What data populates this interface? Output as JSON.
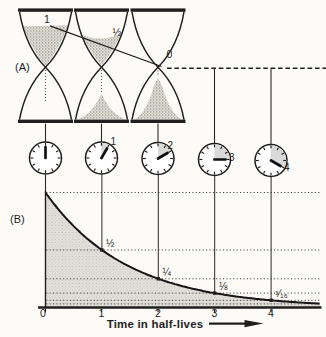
{
  "panel_a_label": "(A)",
  "panel_b_label": "(B)",
  "hourglasses": [
    {
      "label": "1",
      "top_bulb": "full",
      "bottom_bulb": "empty"
    },
    {
      "label": "½",
      "top_bulb": "half",
      "bottom_bulb": "small pile"
    },
    {
      "label": "0",
      "top_bulb": "empty",
      "bottom_bulb": "full pile"
    }
  ],
  "clocks": [
    {
      "hours": 0,
      "label": ""
    },
    {
      "hours": 1,
      "label": "1"
    },
    {
      "hours": 2,
      "label": "2"
    },
    {
      "hours": 3,
      "label": "3"
    },
    {
      "hours": 4,
      "label": "4"
    }
  ],
  "graph": {
    "x_axis_title": "Time in half-lives",
    "x_ticks": [
      "0",
      "1",
      "2",
      "3",
      "4"
    ],
    "point_labels": [
      "½",
      "¼",
      "⅛",
      "¹⁄₁₆"
    ]
  },
  "chart_data": {
    "type": "area",
    "x": [
      0,
      1,
      2,
      3,
      4
    ],
    "values": [
      1,
      0.5,
      0.25,
      0.125,
      0.0625
    ],
    "point_labels": [
      "½",
      "¼",
      "⅛",
      "¹⁄₁₆"
    ],
    "xlabel": "Time in half-lives",
    "ylabel": "",
    "xlim": [
      0,
      4.9
    ],
    "ylim": [
      0,
      1
    ],
    "gridlines": [
      1,
      0.5,
      0.25,
      0.125,
      0.0625,
      0.03125
    ],
    "grid_style": "dotted",
    "curve": "N = (1/2)^t",
    "legend": "none"
  },
  "colors": {
    "ink": "#1f1f1f",
    "background": "#fcfbf8",
    "sand": "#d8d5cc",
    "area_shade": "#dddcd7",
    "clock_wedge": "#d9d9d9"
  }
}
